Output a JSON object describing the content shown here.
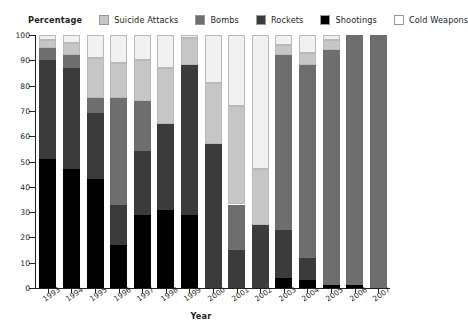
{
  "chart_data": {
    "type": "bar",
    "stacked": true,
    "title": "",
    "xlabel": "Year",
    "ylabel": "Percentage",
    "ylim": [
      0,
      100
    ],
    "yticks": [
      0,
      10,
      20,
      30,
      40,
      50,
      60,
      70,
      80,
      90,
      100
    ],
    "grid": false,
    "legend_position": "top",
    "categories": [
      "1993",
      "1994",
      "1995",
      "1996",
      "1997",
      "1998",
      "1999",
      "2000",
      "2001",
      "2002",
      "2003",
      "2004",
      "2005",
      "2006",
      "2007"
    ],
    "series": [
      {
        "name": "Cold Weapons",
        "color": "#000000",
        "values": [
          51,
          47,
          43,
          17,
          29,
          31,
          29,
          0,
          0,
          0,
          4,
          3,
          1,
          1,
          0
        ]
      },
      {
        "name": "Shootings",
        "color": "#3b3b3b",
        "values": [
          39,
          40,
          26,
          16,
          25,
          34,
          59,
          57,
          15,
          25,
          19,
          9,
          0,
          0,
          0
        ]
      },
      {
        "name": "Rockets",
        "color": "#6e6e6e",
        "values": [
          5,
          5,
          6,
          42,
          20,
          0,
          0,
          0,
          18,
          0,
          69,
          76,
          93,
          99,
          100
        ]
      },
      {
        "name": "Bombs",
        "color": "#c6c6c6",
        "values": [
          3,
          5,
          16,
          14,
          16,
          22,
          11,
          24,
          39,
          22,
          4,
          5,
          4,
          0,
          0
        ]
      },
      {
        "name": "Suicide Attacks",
        "color": "#f1f1f1",
        "values": [
          2,
          3,
          9,
          11,
          10,
          13,
          1,
          19,
          28,
          53,
          4,
          7,
          2,
          0,
          0
        ]
      }
    ]
  },
  "legend": {
    "axis_label": "Percentage",
    "items": [
      {
        "label": "Suicide Attacks",
        "color": "#f1f1f1"
      },
      {
        "label": "Bombs",
        "color": "#c6c6c6"
      },
      {
        "label": "Rockets",
        "color": "#6e6e6e"
      },
      {
        "label": "Shootings",
        "color": "#3b3b3b"
      },
      {
        "label": "Cold Weapons",
        "color": "#000000"
      }
    ]
  },
  "axes": {
    "x_title": "Year",
    "y_title": "Percentage"
  }
}
